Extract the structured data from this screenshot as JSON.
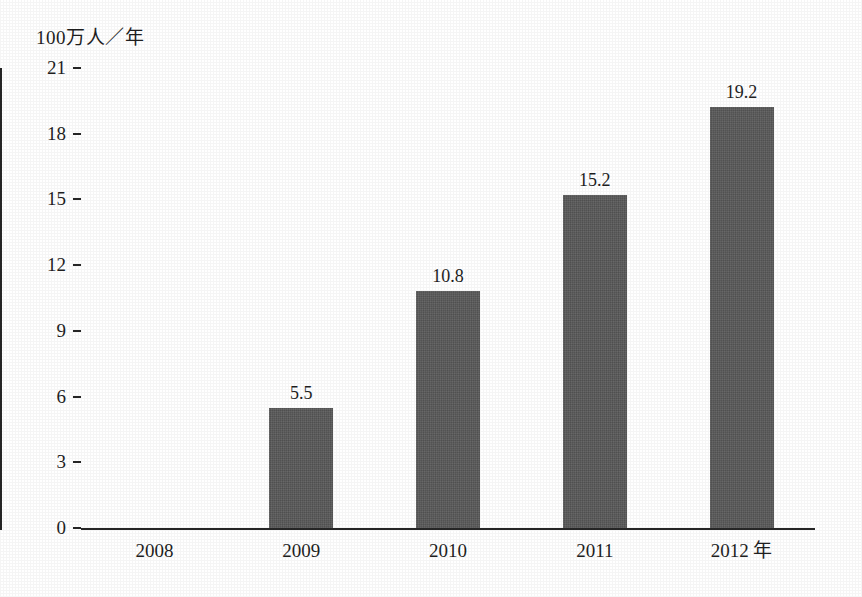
{
  "chart_data": {
    "type": "bar",
    "title": "",
    "subtitle": "",
    "xlabel": "",
    "ylabel": "100万人／年",
    "y_unit_caption": "100万人／年",
    "x_unit_suffix": "年",
    "categories": [
      "2008",
      "2009",
      "2010",
      "2011",
      "2012"
    ],
    "tick_labels_x": [
      "2008",
      "2009",
      "2010",
      "2011",
      "2012 年"
    ],
    "values": [
      0,
      5.5,
      10.8,
      15.2,
      19.2
    ],
    "value_labels": [
      "",
      "5.5",
      "10.8",
      "15.2",
      "19.2"
    ],
    "ylim": [
      0,
      21
    ],
    "yticks": [
      0,
      3,
      6,
      9,
      12,
      15,
      18,
      21
    ],
    "ytick_labels": [
      "0",
      "3",
      "6",
      "9",
      "12",
      "15",
      "18",
      "21"
    ],
    "grid": false,
    "legend": false,
    "legend_position": "none",
    "bar_color": "#595959",
    "axis_color": "#262626",
    "text_color": "#1f1f1f",
    "background_color": "#ffffff",
    "series": [
      {
        "name": "",
        "values": [
          0,
          5.5,
          10.8,
          15.2,
          19.2
        ]
      }
    ],
    "points": [
      {
        "category": "2008",
        "value": 0,
        "label": ""
      },
      {
        "category": "2009",
        "value": 5.5,
        "label": "5.5"
      },
      {
        "category": "2010",
        "value": 10.8,
        "label": "10.8"
      },
      {
        "category": "2011",
        "value": 15.2,
        "label": "15.2"
      },
      {
        "category": "2012",
        "value": 19.2,
        "label": "19.2"
      }
    ]
  }
}
